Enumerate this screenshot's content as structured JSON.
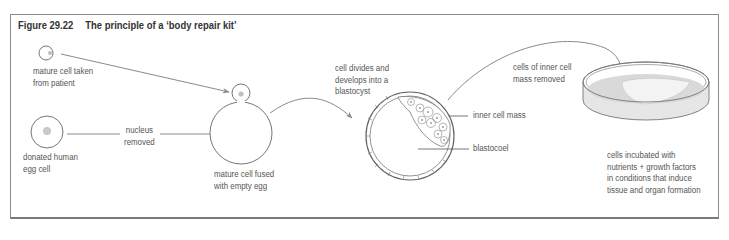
{
  "figure": {
    "number": "Figure 29.22",
    "title": "The principle of a ‘body repair kit’"
  },
  "labels": {
    "mature_cell": "mature cell taken\nfrom patient",
    "donated_egg": "donated human\negg cell",
    "nucleus_removed": "nucleus\nremoved",
    "fused_cell": "mature cell fused\nwith empty egg",
    "cell_divides": "cell divides and\ndevelops into a\nblastocyst",
    "inner_cell_mass": "inner cell mass",
    "blastocoel": "blastocoel",
    "cells_removed": "cells of inner cell\nmass removed",
    "incubated": "cells incubated with\nnutrients + growth factors\nin conditions that induce\ntissue and organ formation"
  },
  "colors": {
    "line": "#555555",
    "arrow": "#888888",
    "nucleus": "#bdbdbd",
    "dish_fill": "#d9d9d9",
    "tissue": "#f2f2f2"
  }
}
